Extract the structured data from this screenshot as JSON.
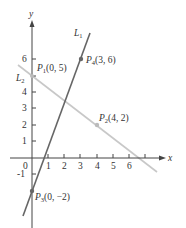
{
  "diagram": {
    "type": "coordinate-plane",
    "axes": {
      "x_label": "x",
      "y_label": "y",
      "x_ticks": [
        "0",
        "1",
        "2",
        "3",
        "4",
        "5",
        "6"
      ],
      "y_ticks": [
        "-1",
        "1",
        "2",
        "3",
        "4",
        "6"
      ]
    },
    "lines": [
      {
        "name": "L",
        "sub": "1",
        "through": [
          "P3(0,-2)",
          "P4(3,6)"
        ],
        "color": "#666666"
      },
      {
        "name": "L",
        "sub": "2",
        "through": [
          "P1(0,5)",
          "P2(4,2)"
        ],
        "color": "#c8c8c8"
      }
    ],
    "points": [
      {
        "name": "P",
        "sub": "1",
        "coords": "(0, 5)",
        "x": 0,
        "y": 5
      },
      {
        "name": "P",
        "sub": "2",
        "coords": "(4, 2)",
        "x": 4,
        "y": 2
      },
      {
        "name": "P",
        "sub": "3",
        "coords": "(0, −2)",
        "x": 0,
        "y": -2
      },
      {
        "name": "P",
        "sub": "4",
        "coords": "(3, 6)",
        "x": 3,
        "y": 6
      }
    ]
  }
}
